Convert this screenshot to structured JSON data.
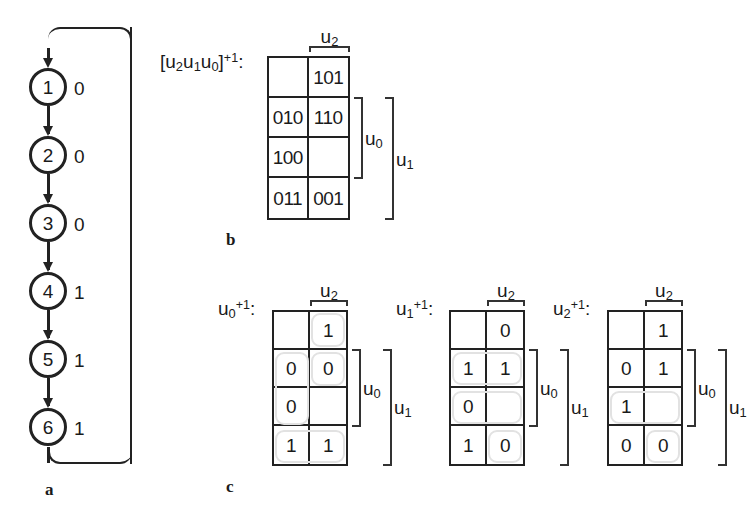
{
  "figure": {
    "panels": [
      {
        "id": "a",
        "caption": "a"
      },
      {
        "id": "b",
        "caption": "b"
      },
      {
        "id": "c",
        "caption": "c"
      }
    ]
  },
  "state_diagram": {
    "nodes": [
      {
        "state": "1",
        "output": "0"
      },
      {
        "state": "2",
        "output": "0"
      },
      {
        "state": "3",
        "output": "0"
      },
      {
        "state": "4",
        "output": "1"
      },
      {
        "state": "5",
        "output": "1"
      },
      {
        "state": "6",
        "output": "1"
      }
    ],
    "feedback": {
      "from": "6",
      "to": "1"
    }
  },
  "kmap_b": {
    "label_prefix": "[u",
    "label": "[u2u1u0]+1:",
    "label_parts": {
      "lead": "[u",
      "s2": "2",
      "u1": "u",
      "s1": "1",
      "u0": "u",
      "s0": "0",
      "close": "]",
      "sup": "+1",
      "colon": ":"
    },
    "top_label": {
      "name": "u",
      "sub": "2"
    },
    "side_labels": [
      {
        "name": "u",
        "sub": "0"
      },
      {
        "name": "u",
        "sub": "1"
      }
    ],
    "cells": [
      [
        "",
        "101"
      ],
      [
        "010",
        "110"
      ],
      [
        "100",
        ""
      ],
      [
        "011",
        "001"
      ]
    ]
  },
  "kmaps_c": [
    {
      "label_parts": {
        "name": "u",
        "sub": "0",
        "sup": "+1",
        "colon": ":"
      },
      "top_label": {
        "name": "u",
        "sub": "2"
      },
      "side_labels": [
        {
          "name": "u",
          "sub": "0"
        },
        {
          "name": "u",
          "sub": "1"
        }
      ],
      "cells": [
        [
          "",
          "1"
        ],
        [
          "0",
          "0"
        ],
        [
          "0",
          ""
        ],
        [
          "1",
          "1"
        ]
      ],
      "groups": [
        {
          "row": 0,
          "col": 1,
          "rows": 1,
          "cols": 1
        },
        {
          "row": 1,
          "col": 0,
          "rows": 2,
          "cols": 1
        },
        {
          "row": 1,
          "col": 1,
          "rows": 1,
          "cols": 1
        },
        {
          "row": 3,
          "col": 0,
          "rows": 1,
          "cols": 2
        }
      ]
    },
    {
      "label_parts": {
        "name": "u",
        "sub": "1",
        "sup": "+1",
        "colon": ":"
      },
      "top_label": {
        "name": "u",
        "sub": "2"
      },
      "side_labels": [
        {
          "name": "u",
          "sub": "0"
        },
        {
          "name": "u",
          "sub": "1"
        }
      ],
      "cells": [
        [
          "",
          "0"
        ],
        [
          "1",
          "1"
        ],
        [
          "0",
          ""
        ],
        [
          "1",
          "0"
        ]
      ],
      "groups": [
        {
          "row": 1,
          "col": 0,
          "rows": 1,
          "cols": 2
        },
        {
          "row": 2,
          "col": 0,
          "rows": 1,
          "cols": 2
        },
        {
          "row": 3,
          "col": 1,
          "rows": 1,
          "cols": 1
        }
      ]
    },
    {
      "label_parts": {
        "name": "u",
        "sub": "2",
        "sup": "+1",
        "colon": ":"
      },
      "top_label": {
        "name": "u",
        "sub": "2"
      },
      "side_labels": [
        {
          "name": "u",
          "sub": "0"
        },
        {
          "name": "u",
          "sub": "1"
        }
      ],
      "cells": [
        [
          "",
          "1"
        ],
        [
          "0",
          "1"
        ],
        [
          "1",
          ""
        ],
        [
          "0",
          "0"
        ]
      ],
      "groups": [
        {
          "row": 2,
          "col": 0,
          "rows": 1,
          "cols": 2
        },
        {
          "row": 3,
          "col": 1,
          "rows": 1,
          "cols": 1
        }
      ]
    }
  ]
}
